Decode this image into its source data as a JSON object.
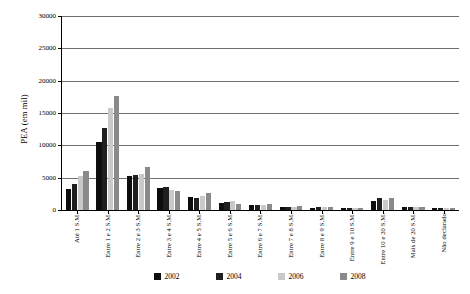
{
  "chart_data": {
    "type": "bar",
    "title": "",
    "subtitle": "",
    "xlabel": "",
    "ylabel": "PEA (em mil)",
    "ylim": [
      0,
      30000
    ],
    "ytick_values": [
      0,
      5000,
      10000,
      15000,
      20000,
      25000,
      30000
    ],
    "ytick_labels": [
      "0",
      "5000",
      "10000",
      "15000",
      "20000",
      "25000",
      "30000"
    ],
    "grid": true,
    "legend_position": "bottom",
    "categories": [
      "Até 1 S.M.",
      "Entre 1 e 2 S.M.",
      "Entre 2 e 3 S.M.",
      "Entre 3 e 4 S.M.",
      "Entre 4 e 5 S.M.",
      "Entre 5 e 6 S.M.",
      "Entre 6 e 7 S.M.",
      "Entre 7 e 8 S.M.",
      "Entre 8 e 9 S.M.",
      "Entre 9 e 10 S.M.",
      "Entre 10 e 20 S.M.",
      "Mais de 20 S.M.",
      "Não declarado"
    ],
    "series": [
      {
        "name": "2002",
        "color": "#0d0d0d",
        "values": [
          3300,
          10500,
          5300,
          3400,
          2000,
          1100,
          700,
          400,
          350,
          250,
          1450,
          450,
          300
        ]
      },
      {
        "name": "2004",
        "color": "#1f1f1f",
        "values": [
          4000,
          12700,
          5400,
          3500,
          1800,
          1200,
          800,
          500,
          400,
          300,
          1900,
          500,
          350
        ]
      },
      {
        "name": "2006",
        "color": "#c9c9c9",
        "values": [
          5300,
          15700,
          5500,
          3100,
          2100,
          1400,
          800,
          500,
          450,
          350,
          1500,
          500,
          350
        ]
      },
      {
        "name": "2008",
        "color": "#8a8a8a",
        "values": [
          6000,
          17600,
          6700,
          2900,
          2600,
          1000,
          900,
          600,
          450,
          350,
          1800,
          450,
          350
        ]
      }
    ]
  }
}
